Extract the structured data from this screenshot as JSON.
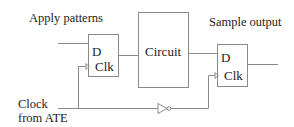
{
  "labels": {
    "apply_patterns": "Apply patterns",
    "sample_output": "Sample output",
    "clock_line1": "Clock",
    "clock_line2": "from ATE"
  },
  "blocks": {
    "ff_input": {
      "d": "D",
      "clk": "Clk"
    },
    "circuit": "Circuit",
    "ff_output": {
      "d": "D",
      "clk": "Clk"
    }
  },
  "colors": {
    "line": "#8a8a8a",
    "text": "#222222"
  }
}
